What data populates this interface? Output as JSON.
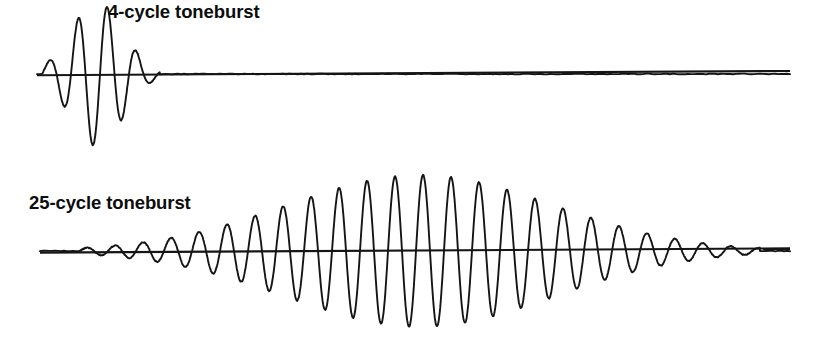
{
  "figure": {
    "name": "toneburst-waveform-comparison",
    "background_color": "#ffffff",
    "stroke_color": "#151515",
    "width": 817,
    "height": 340
  },
  "labels": {
    "top": "4-cycle toneburst",
    "bottom": "25-cycle toneburst"
  },
  "chart_data": {
    "type": "line",
    "title": "",
    "xlabel": "",
    "ylabel": "",
    "grid": false,
    "legend": "none",
    "annotations": [
      "4-cycle toneburst",
      "25-cycle toneburst"
    ],
    "series": [
      {
        "name": "4-cycle toneburst",
        "cycles": 4,
        "baseline_y": 74,
        "x_start": 37,
        "x_end": 790,
        "burst_start_x": 42,
        "burst_end_x": 160,
        "period_px": 29,
        "peak_amplitude_px": 72,
        "envelope": "gaussian",
        "envelope_center_x": 97,
        "envelope_sigma_px": 26,
        "description": "Short 4-cycle gaussian-windowed sine burst followed by a long flat baseline"
      },
      {
        "name": "25-cycle toneburst",
        "cycles": 25,
        "baseline_y": 251,
        "x_start": 40,
        "x_end": 790,
        "burst_start_x": 80,
        "burst_end_x": 760,
        "period_px": 28,
        "peak_amplitude_px": 76,
        "envelope": "gaussian",
        "envelope_center_x": 420,
        "envelope_sigma_px": 133,
        "description": "Long 25-cycle gaussian-windowed sine burst spanning nearly the full width"
      }
    ]
  }
}
